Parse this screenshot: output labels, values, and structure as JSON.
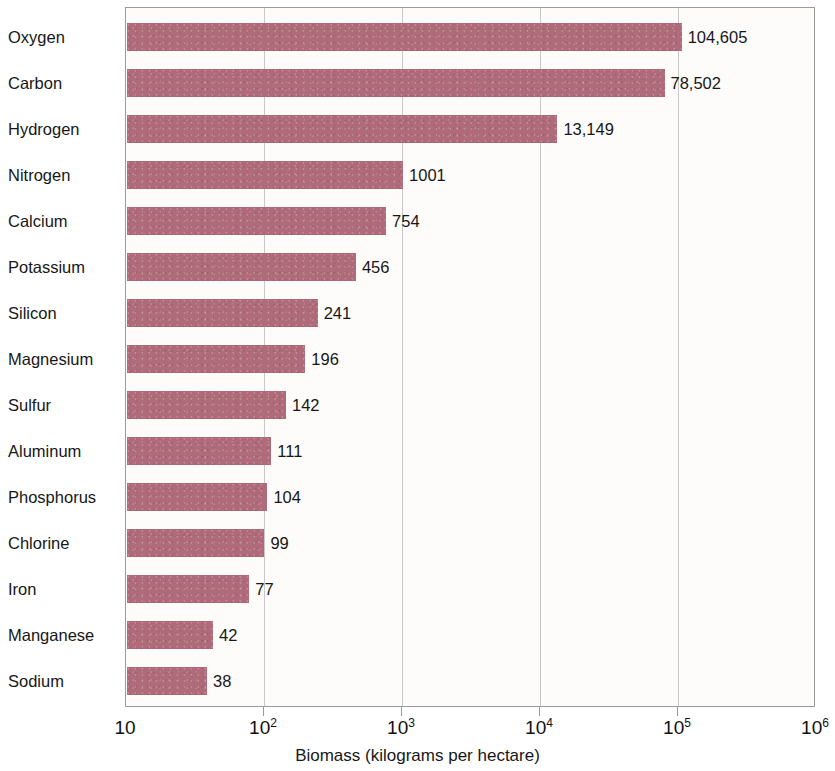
{
  "chart_data": {
    "type": "bar",
    "orientation": "horizontal",
    "title": "",
    "xlabel": "Biomass (kilograms per hectare)",
    "ylabel": "",
    "xscale": "log",
    "xlim": [
      10,
      1000000
    ],
    "grid": true,
    "legend": null,
    "bar_color": "#b06b7a",
    "categories": [
      "Oxygen",
      "Carbon",
      "Hydrogen",
      "Nitrogen",
      "Calcium",
      "Potassium",
      "Silicon",
      "Magnesium",
      "Sulfur",
      "Aluminum",
      "Phosphorus",
      "Chlorine",
      "Iron",
      "Manganese",
      "Sodium"
    ],
    "values": [
      104605,
      78502,
      13149,
      1001,
      754,
      456,
      241,
      196,
      142,
      111,
      104,
      99,
      77,
      42,
      38
    ],
    "value_labels": [
      "104,605",
      "78,502",
      "13,149",
      "1001",
      "754",
      "456",
      "241",
      "196",
      "142",
      "111",
      "104",
      "99",
      "77",
      "42",
      "38"
    ],
    "xticks": [
      10,
      100,
      1000,
      10000,
      100000,
      1000000
    ],
    "xtick_labels": [
      {
        "base": "10",
        "exp": ""
      },
      {
        "base": "10",
        "exp": "2"
      },
      {
        "base": "10",
        "exp": "3"
      },
      {
        "base": "10",
        "exp": "4"
      },
      {
        "base": "10",
        "exp": "5"
      },
      {
        "base": "10",
        "exp": "6"
      }
    ]
  }
}
